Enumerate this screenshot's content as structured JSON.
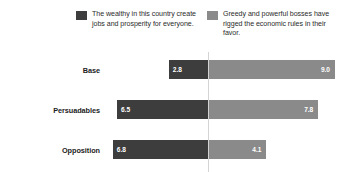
{
  "legend": {
    "entries": [
      {
        "swatch_name": "legend-swatch-negative",
        "color": "#3d3d3d",
        "label": "The wealthy in this country create jobs and prosperity for everyone."
      },
      {
        "swatch_name": "legend-swatch-positive",
        "color": "#8a8a8a",
        "label": "Greedy and powerful bosses have rigged the economic rules in their favor."
      }
    ]
  },
  "chart_data": {
    "type": "bar",
    "subtype": "diverging-horizontal",
    "title": "",
    "subtitle": "",
    "xlabel": "",
    "ylabel": "",
    "categories": [
      "Base",
      "Persuadables",
      "Opposition"
    ],
    "series": [
      {
        "name": "The wealthy in this country create jobs and prosperity for everyone.",
        "color": "#3d3d3d",
        "direction": "left",
        "values": [
          2.8,
          6.5,
          6.8
        ],
        "labels": [
          "2.8",
          "6.5",
          "6.8"
        ]
      },
      {
        "name": "Greedy and powerful bosses have rigged the economic rules in their favor.",
        "color": "#8a8a8a",
        "direction": "right",
        "values": [
          9.0,
          7.8,
          4.1
        ],
        "labels": [
          "9.0",
          "7.8",
          "4.1"
        ]
      }
    ],
    "axis": {
      "center_value": 0,
      "left_max": 9.0,
      "right_max": 9.0,
      "grid": false,
      "tick_labels": [],
      "baseline_color": "#d4d4d4"
    },
    "legend_position": "top",
    "data_labels": true,
    "background": "#ffffff"
  }
}
